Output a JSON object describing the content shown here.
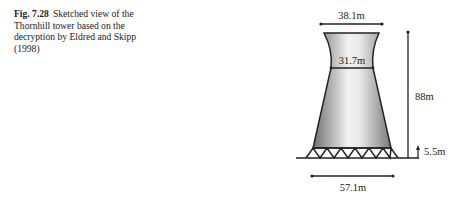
{
  "caption": {
    "figure_number": "Fig. 7.28",
    "text": "Sketched view of the Thornhill tower based on the decryption by Eldred and Skipp (1998)"
  },
  "diagram": {
    "labels": {
      "top_diameter": "38.1m",
      "throat_diameter": "31.7m",
      "height": "88m",
      "column_height": "5.5m",
      "base_diameter": "57.1m"
    }
  }
}
